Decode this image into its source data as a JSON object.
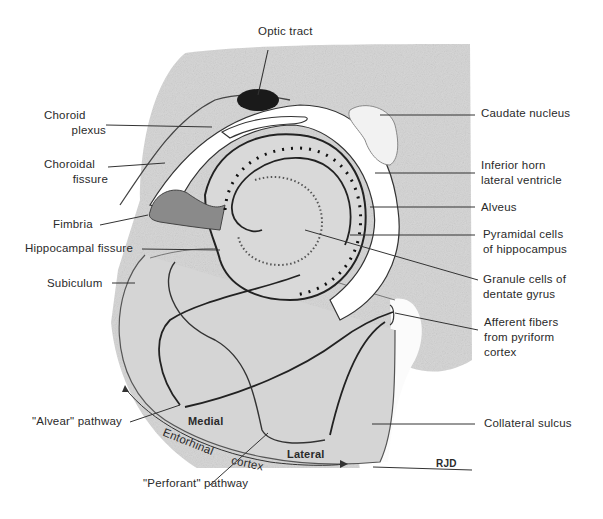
{
  "figure": {
    "labels_left": [
      {
        "id": "choroid-plexus",
        "lines": [
          "Choroid",
          "plexus"
        ]
      },
      {
        "id": "choroidal-fissure",
        "lines": [
          "Choroidal",
          "fissure"
        ]
      },
      {
        "id": "fimbria",
        "lines": [
          "Fimbria"
        ]
      },
      {
        "id": "hippocampal-fissure",
        "lines": [
          "Hippocampal fissure"
        ]
      },
      {
        "id": "subiculum",
        "lines": [
          "Subiculum"
        ]
      },
      {
        "id": "alvear-pathway",
        "lines": [
          "\"Alvear\" pathway"
        ]
      }
    ],
    "labels_right": [
      {
        "id": "caudate-nucleus",
        "lines": [
          "Caudate nucleus"
        ]
      },
      {
        "id": "inferior-horn",
        "lines": [
          "Inferior horn",
          "lateral ventricle"
        ]
      },
      {
        "id": "alveus",
        "lines": [
          "Alveus"
        ]
      },
      {
        "id": "pyramidal-cells",
        "lines": [
          "Pyramidal cells",
          "of hippocampus"
        ]
      },
      {
        "id": "granule-cells",
        "lines": [
          "Granule cells of",
          "dentate gyrus"
        ]
      },
      {
        "id": "afferent-fibers",
        "lines": [
          "Afferent fibers",
          "from pyriform",
          "cortex"
        ]
      },
      {
        "id": "collateral-sulcus",
        "lines": [
          "Collateral sulcus"
        ]
      }
    ],
    "labels_top": [
      {
        "id": "optic-tract",
        "lines": [
          "Optic tract"
        ]
      }
    ],
    "labels_bottom": [
      {
        "id": "perforant-pathway",
        "lines": [
          "\"Perforant\" pathway"
        ]
      }
    ],
    "region_labels": {
      "medial": "Medial",
      "lateral": "Lateral",
      "entorhinal": "Entorhinal",
      "cortex": "cortex"
    },
    "signature": "RJD"
  },
  "colors": {
    "tissue": "#c9c9c9",
    "tissue_light": "#e2e2e2",
    "line": "#2b2b2b",
    "optic": "#1a1a1a"
  }
}
